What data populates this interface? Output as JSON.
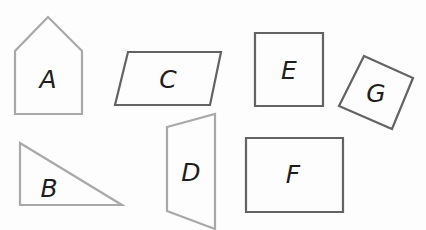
{
  "diagram": {
    "colors": {
      "light_stroke": "#a9a9a9",
      "dark_stroke": "#636363",
      "label": "#1e1e1e",
      "background": "#fdfdfd"
    },
    "shapes": [
      {
        "id": "A",
        "label": "A",
        "kind": "pentagon",
        "stroke": "light",
        "points": "48,17 82,51 82,114 15,114 15,51",
        "label_x": 48,
        "label_y": 79
      },
      {
        "id": "C",
        "label": "C",
        "kind": "parallelogram",
        "stroke": "dark",
        "points": "128,52 221,52 210,105 115,105",
        "label_x": 168,
        "label_y": 79
      },
      {
        "id": "E",
        "label": "E",
        "kind": "square",
        "stroke": "dark",
        "points": "255,33 323,33 323,106 255,106",
        "label_x": 289,
        "label_y": 70
      },
      {
        "id": "G",
        "label": "G",
        "kind": "rotated-square",
        "stroke": "dark",
        "points": "364,56 413,78 392,129 339,106",
        "label_x": 376,
        "label_y": 93
      },
      {
        "id": "B",
        "label": "B",
        "kind": "right-triangle",
        "stroke": "light",
        "points": "20,143 122,205 20,205",
        "label_x": 49,
        "label_y": 188
      },
      {
        "id": "D",
        "label": "D",
        "kind": "trapezoid",
        "stroke": "light",
        "points": "167,127 215,114 215,229 167,211",
        "label_x": 191,
        "label_y": 172
      },
      {
        "id": "F",
        "label": "F",
        "kind": "rectangle",
        "stroke": "dark",
        "points": "246,138 343,138 343,212 246,212",
        "label_x": 293,
        "label_y": 174
      }
    ]
  }
}
